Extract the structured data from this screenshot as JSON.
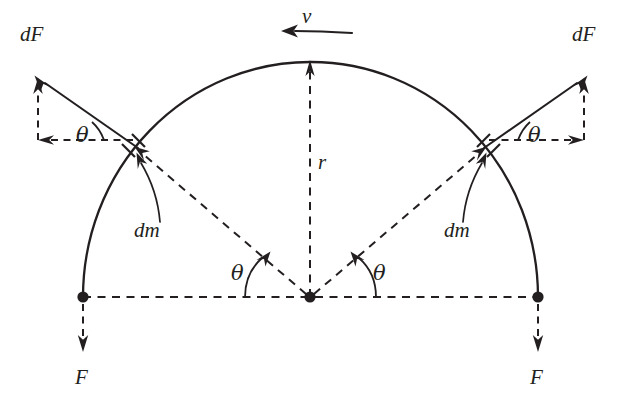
{
  "figure": {
    "kind": "physics-free-body-diagram",
    "ink_color": "#231f20",
    "background_color": "#ffffff"
  },
  "labels": {
    "dF_left": "dF",
    "dF_right": "dF",
    "theta_upper_left": "θ",
    "theta_upper_right": "θ",
    "theta_center_left": "θ",
    "theta_center_right": "θ",
    "dm_left": "dm",
    "dm_right": "dm",
    "radius": "r",
    "velocity": "v",
    "F_left": "F",
    "F_right": "F"
  },
  "label_positions": {
    "dF_left": {
      "x": 20,
      "y": 24
    },
    "dF_right": {
      "x": 572,
      "y": 24
    },
    "theta_upper_left": {
      "x": 76,
      "y": 125
    },
    "theta_upper_right": {
      "x": 528,
      "y": 125
    },
    "theta_center_left": {
      "x": 231,
      "y": 263
    },
    "theta_center_right": {
      "x": 373,
      "y": 263
    },
    "dm_left": {
      "x": 134,
      "y": 220
    },
    "dm_right": {
      "x": 444,
      "y": 220
    },
    "radius": {
      "x": 318,
      "y": 152
    },
    "velocity": {
      "x": 302,
      "y": 6
    },
    "F_left": {
      "x": 75,
      "y": 367
    },
    "F_right": {
      "x": 530,
      "y": 367
    }
  },
  "geometry": {
    "center": {
      "x": 310,
      "y": 297
    },
    "radius_x": 227,
    "radius_y": 235,
    "arc_left_end": {
      "x": 83,
      "y": 297
    },
    "arc_right_end": {
      "x": 538,
      "y": 297
    },
    "arc_apex": {
      "x": 310,
      "y": 62
    },
    "dm_left": {
      "x": 138,
      "y": 148
    },
    "dm_right": {
      "x": 484,
      "y": 148
    },
    "dF_left_tip": {
      "x": 38,
      "y": 78
    },
    "dF_right_tip": {
      "x": 584,
      "y": 78
    },
    "dF_component_corner_left": {
      "x": 38,
      "y": 140
    },
    "dF_component_corner_right": {
      "x": 584,
      "y": 140
    },
    "F_left_tip": {
      "x": 83,
      "y": 350
    },
    "F_right_tip": {
      "x": 538,
      "y": 350
    },
    "velocity_arrow": {
      "from_x": 352,
      "to_x": 283,
      "y": 31
    },
    "theta_degrees": 45
  }
}
